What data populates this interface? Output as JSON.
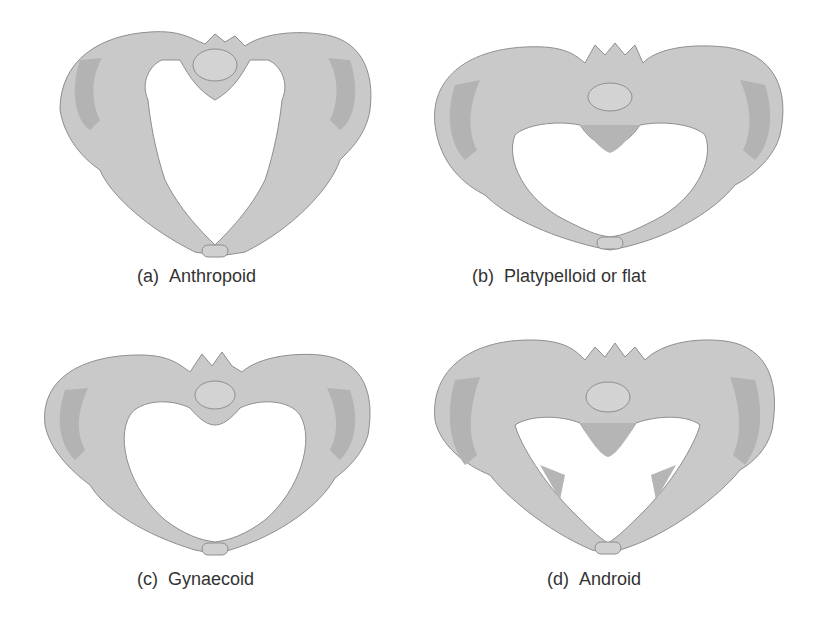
{
  "colors": {
    "bone": "#c9c9c9",
    "bone_dark": "#a9a9a9",
    "outline": "#8e8e8e",
    "highlight": "#ececec",
    "caption": "#333333",
    "background": "#ffffff"
  },
  "panels": [
    {
      "tag": "(a)",
      "label": "Anthropoid",
      "inlet_shape": "oval-anteroposterior"
    },
    {
      "tag": "(b)",
      "label": "Platypelloid or flat",
      "inlet_shape": "transverse-oval"
    },
    {
      "tag": "(c)",
      "label": "Gynaecoid",
      "inlet_shape": "round"
    },
    {
      "tag": "(d)",
      "label": "Android",
      "inlet_shape": "heart"
    }
  ]
}
